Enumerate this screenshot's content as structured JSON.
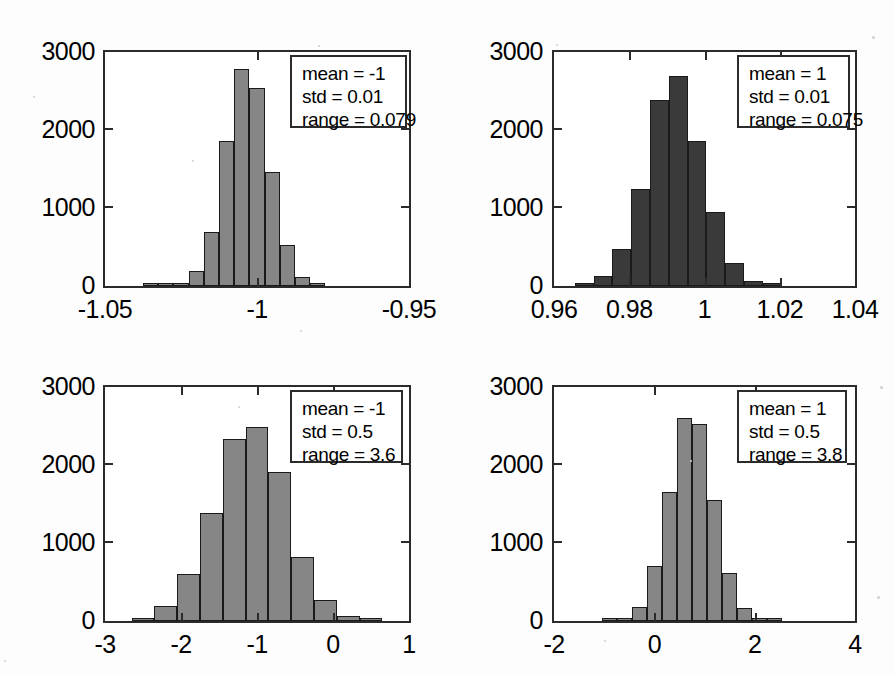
{
  "figure": {
    "title": "",
    "background": "#fdfdfd",
    "layout": "2x2 grid of histograms"
  },
  "colors": {
    "axis": "#2b2b2b",
    "bar_light": "#868686",
    "bar_dark": "#3a3a3a",
    "bar_edge": "#1a1a1a",
    "text": "#000000",
    "background": "#ffffff"
  },
  "chart_data": [
    {
      "type": "bar",
      "id": "hist-top-left",
      "title": "",
      "xlabel": "",
      "ylabel": "",
      "xlim": [
        -1.05,
        -0.95
      ],
      "ylim": [
        0,
        3000
      ],
      "xticks": [
        -1.05,
        -1,
        -0.95
      ],
      "xticklabels": [
        "-1.05",
        "-1",
        "-0.95"
      ],
      "yticks": [
        0,
        1000,
        2000,
        3000
      ],
      "yticklabels": [
        "0",
        "1000",
        "2000",
        "3000"
      ],
      "grid": false,
      "bar_color": "#868686",
      "bin_edges": [
        -1.0375,
        -1.0325,
        -1.0275,
        -1.0225,
        -1.0175,
        -1.0125,
        -1.0075,
        -1.0025,
        -0.9975,
        -0.9925,
        -0.9875,
        -0.9825,
        -0.9775,
        -0.9725,
        -0.9675,
        -0.9625
      ],
      "values": [
        15,
        25,
        40,
        190,
        690,
        1860,
        2780,
        2540,
        1460,
        520,
        120,
        35,
        0,
        0,
        0
      ],
      "annotation": {
        "mean_label": "mean = -1",
        "std_label": "std = 0.01",
        "range_label": "range = 0.079",
        "mean": -1,
        "std": 0.01,
        "range": 0.079
      }
    },
    {
      "type": "bar",
      "id": "hist-top-right",
      "title": "",
      "xlabel": "",
      "ylabel": "",
      "xlim": [
        0.96,
        1.04
      ],
      "ylim": [
        0,
        3000
      ],
      "xticks": [
        0.96,
        0.98,
        1.0,
        1.02,
        1.04
      ],
      "xticklabels": [
        "0.96",
        "0.98",
        "1",
        "1.02",
        "1.04"
      ],
      "yticks": [
        0,
        1000,
        2000,
        3000
      ],
      "yticklabels": [
        "0",
        "1000",
        "2000",
        "3000"
      ],
      "grid": false,
      "bar_color": "#3a3a3a",
      "bin_edges": [
        0.9655,
        0.9705,
        0.9755,
        0.9805,
        0.9855,
        0.9905,
        0.9955,
        1.0005,
        1.0055,
        1.0105,
        1.0155,
        1.0205,
        1.0255,
        1.0305
      ],
      "values": [
        30,
        130,
        470,
        1250,
        2380,
        2690,
        1860,
        950,
        300,
        70,
        25,
        0,
        0
      ],
      "annotation": {
        "mean_label": "mean = 1",
        "std_label": "std = 0.01",
        "range_label": "range = 0.075",
        "mean": 1,
        "std": 0.01,
        "range": 0.075
      }
    },
    {
      "type": "bar",
      "id": "hist-bottom-left",
      "title": "",
      "xlabel": "",
      "ylabel": "",
      "xlim": [
        -3,
        1
      ],
      "ylim": [
        0,
        3000
      ],
      "xticks": [
        -3,
        -2,
        -1,
        0,
        1
      ],
      "xticklabels": [
        "-3",
        "-2",
        "-1",
        "0",
        "1"
      ],
      "yticks": [
        0,
        1000,
        2000,
        3000
      ],
      "yticklabels": [
        "0",
        "1000",
        "2000",
        "3000"
      ],
      "grid": false,
      "bar_color": "#868686",
      "bin_edges": [
        -2.65,
        -2.35,
        -2.05,
        -1.75,
        -1.45,
        -1.15,
        -0.85,
        -0.55,
        -0.25,
        0.05,
        0.35,
        0.65,
        0.95
      ],
      "values": [
        25,
        190,
        600,
        1390,
        2330,
        2490,
        1910,
        820,
        270,
        70,
        25,
        0
      ],
      "annotation": {
        "mean_label": "mean = -1",
        "std_label": "std = 0.5",
        "range_label": "range = 3.6",
        "mean": -1,
        "std": 0.5,
        "range": 3.6
      }
    },
    {
      "type": "bar",
      "id": "hist-bottom-right",
      "title": "",
      "xlabel": "",
      "ylabel": "",
      "xlim": [
        -2,
        4
      ],
      "ylim": [
        0,
        3000
      ],
      "xticks": [
        -2,
        0,
        2,
        4
      ],
      "xticklabels": [
        "-2",
        "0",
        "2",
        "4"
      ],
      "yticks": [
        0,
        1000,
        2000,
        3000
      ],
      "yticklabels": [
        "0",
        "1000",
        "2000",
        "3000"
      ],
      "grid": false,
      "bar_color": "#868686",
      "bin_edges": [
        -1.05,
        -0.75,
        -0.45,
        -0.15,
        0.15,
        0.45,
        0.75,
        1.05,
        1.35,
        1.65,
        1.95,
        2.25,
        2.55,
        2.85
      ],
      "values": [
        20,
        30,
        180,
        710,
        1660,
        2600,
        2530,
        1550,
        620,
        170,
        40,
        10,
        0
      ],
      "annotation": {
        "mean_label": "mean = 1",
        "std_label": "std = 0.5",
        "range_label": "range = 3.8",
        "mean": 1,
        "std": 0.5,
        "range": 3.8
      }
    }
  ]
}
